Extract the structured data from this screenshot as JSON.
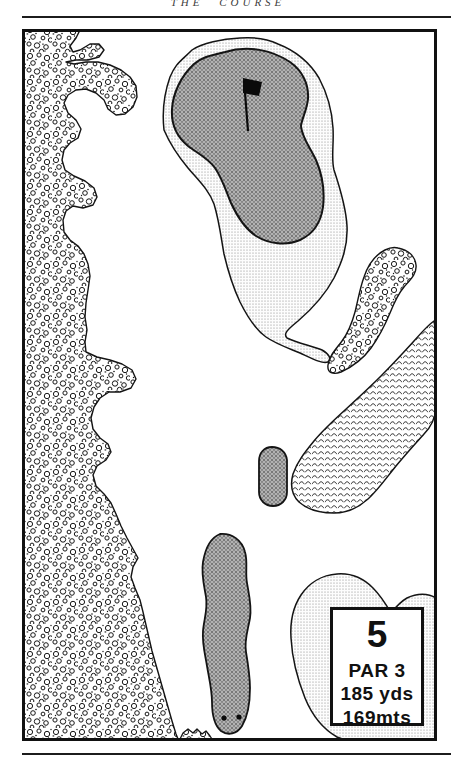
{
  "page": {
    "running_header": "THE COURSE"
  },
  "hole_card": {
    "hole_number": "5",
    "par": "PAR 3",
    "distance_yards": "185 yds",
    "distance_meters": "169mts"
  },
  "map": {
    "features": [
      "beach-dunes",
      "putting-green",
      "green-fringe",
      "pin-flag",
      "scrub-patch",
      "water-hazard",
      "greenside-bunker",
      "tee-box",
      "tee-markers",
      "dune-blob"
    ],
    "ink_color": "#141414",
    "fringe_tone": "#e3e3e3",
    "green_tone": "#ababab"
  }
}
